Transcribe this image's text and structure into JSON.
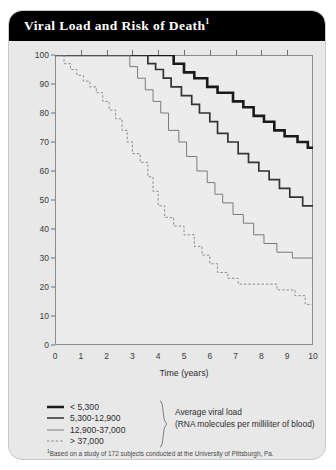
{
  "card": {
    "title": "Viral  Load and Risk of Death",
    "title_marker": "1"
  },
  "chart_data": {
    "type": "line",
    "title": "Viral Load and Risk of Death",
    "xlabel": "Time (years)",
    "ylabel": "Percentage of HIV-infected individuals surviving",
    "xlim": [
      0,
      10
    ],
    "ylim": [
      0,
      100
    ],
    "xticks": [
      "0",
      "1",
      "2",
      "3",
      "4",
      "5",
      "6",
      "7",
      "8",
      "9",
      "10"
    ],
    "yticks": [
      "0",
      "10",
      "20",
      "30",
      "40",
      "50",
      "60",
      "70",
      "80",
      "90",
      "100"
    ],
    "grid": false,
    "legend_position": "below-plot",
    "step_style": "kaplan-meier-step",
    "series": [
      {
        "name": "< 5,300",
        "style": "solid",
        "width": 2.6,
        "color": "#1a1a1a",
        "points": [
          [
            0,
            100
          ],
          [
            4.6,
            100
          ],
          [
            4.6,
            97
          ],
          [
            5.0,
            97
          ],
          [
            5.0,
            94
          ],
          [
            5.4,
            94
          ],
          [
            5.4,
            92
          ],
          [
            5.9,
            92
          ],
          [
            5.9,
            89
          ],
          [
            6.3,
            89
          ],
          [
            6.3,
            87
          ],
          [
            6.9,
            87
          ],
          [
            6.9,
            84
          ],
          [
            7.3,
            84
          ],
          [
            7.3,
            82
          ],
          [
            7.7,
            82
          ],
          [
            7.7,
            79
          ],
          [
            8.1,
            79
          ],
          [
            8.1,
            77
          ],
          [
            8.5,
            77
          ],
          [
            8.5,
            74
          ],
          [
            8.9,
            74
          ],
          [
            8.9,
            72
          ],
          [
            9.4,
            72
          ],
          [
            9.4,
            70
          ],
          [
            9.8,
            70
          ],
          [
            9.8,
            68
          ],
          [
            10,
            68
          ]
        ]
      },
      {
        "name": "5,300-12,900",
        "style": "solid",
        "width": 1.7,
        "color": "#333333",
        "points": [
          [
            0,
            100
          ],
          [
            3.6,
            100
          ],
          [
            3.6,
            97
          ],
          [
            3.9,
            97
          ],
          [
            3.9,
            95
          ],
          [
            4.2,
            95
          ],
          [
            4.2,
            92
          ],
          [
            4.5,
            92
          ],
          [
            4.5,
            89
          ],
          [
            4.9,
            89
          ],
          [
            4.9,
            86
          ],
          [
            5.3,
            86
          ],
          [
            5.3,
            83
          ],
          [
            5.6,
            83
          ],
          [
            5.6,
            80
          ],
          [
            6.0,
            80
          ],
          [
            6.0,
            77
          ],
          [
            6.3,
            77
          ],
          [
            6.3,
            73
          ],
          [
            6.7,
            73
          ],
          [
            6.7,
            70
          ],
          [
            7.1,
            70
          ],
          [
            7.1,
            66
          ],
          [
            7.5,
            66
          ],
          [
            7.5,
            63
          ],
          [
            7.9,
            63
          ],
          [
            7.9,
            60
          ],
          [
            8.3,
            60
          ],
          [
            8.3,
            57
          ],
          [
            8.7,
            57
          ],
          [
            8.7,
            54
          ],
          [
            9.1,
            54
          ],
          [
            9.1,
            51
          ],
          [
            9.6,
            51
          ],
          [
            9.6,
            48
          ],
          [
            10,
            48
          ]
        ]
      },
      {
        "name": "12,900-37,000",
        "style": "solid",
        "width": 1.0,
        "color": "#7a7a7a",
        "points": [
          [
            0,
            100
          ],
          [
            2.9,
            100
          ],
          [
            2.9,
            96
          ],
          [
            3.2,
            96
          ],
          [
            3.2,
            92
          ],
          [
            3.5,
            92
          ],
          [
            3.5,
            88
          ],
          [
            3.8,
            88
          ],
          [
            3.8,
            84
          ],
          [
            4.1,
            84
          ],
          [
            4.1,
            80
          ],
          [
            4.4,
            80
          ],
          [
            4.4,
            74
          ],
          [
            4.8,
            74
          ],
          [
            4.8,
            70
          ],
          [
            5.1,
            70
          ],
          [
            5.1,
            65
          ],
          [
            5.5,
            65
          ],
          [
            5.5,
            60
          ],
          [
            5.9,
            60
          ],
          [
            5.9,
            56
          ],
          [
            6.2,
            56
          ],
          [
            6.2,
            52
          ],
          [
            6.5,
            52
          ],
          [
            6.5,
            49
          ],
          [
            6.9,
            49
          ],
          [
            6.9,
            45
          ],
          [
            7.3,
            45
          ],
          [
            7.3,
            42
          ],
          [
            7.7,
            42
          ],
          [
            7.7,
            38
          ],
          [
            8.1,
            38
          ],
          [
            8.1,
            35
          ],
          [
            8.6,
            35
          ],
          [
            8.6,
            32
          ],
          [
            9.2,
            32
          ],
          [
            9.2,
            30
          ],
          [
            10,
            30
          ]
        ]
      },
      {
        "name": "> 37,000",
        "style": "dashed",
        "width": 1.0,
        "color": "#8a8a8a",
        "points": [
          [
            0,
            100
          ],
          [
            0.35,
            100
          ],
          [
            0.35,
            97
          ],
          [
            0.6,
            97
          ],
          [
            0.6,
            95
          ],
          [
            0.85,
            95
          ],
          [
            0.85,
            93
          ],
          [
            1.1,
            93
          ],
          [
            1.1,
            91
          ],
          [
            1.35,
            91
          ],
          [
            1.35,
            89
          ],
          [
            1.6,
            89
          ],
          [
            1.6,
            87
          ],
          [
            1.85,
            87
          ],
          [
            1.85,
            84
          ],
          [
            2.1,
            84
          ],
          [
            2.1,
            81
          ],
          [
            2.35,
            81
          ],
          [
            2.35,
            78
          ],
          [
            2.6,
            78
          ],
          [
            2.6,
            74
          ],
          [
            2.8,
            74
          ],
          [
            2.8,
            70
          ],
          [
            3.0,
            70
          ],
          [
            3.0,
            66
          ],
          [
            3.3,
            66
          ],
          [
            3.3,
            63
          ],
          [
            3.6,
            63
          ],
          [
            3.6,
            58
          ],
          [
            3.8,
            58
          ],
          [
            3.8,
            53
          ],
          [
            4.0,
            53
          ],
          [
            4.0,
            48
          ],
          [
            4.25,
            48
          ],
          [
            4.25,
            44
          ],
          [
            4.6,
            44
          ],
          [
            4.6,
            41
          ],
          [
            5.0,
            41
          ],
          [
            5.0,
            38
          ],
          [
            5.4,
            38
          ],
          [
            5.4,
            34
          ],
          [
            5.7,
            34
          ],
          [
            5.7,
            31
          ],
          [
            6.0,
            31
          ],
          [
            6.0,
            28
          ],
          [
            6.3,
            28
          ],
          [
            6.3,
            25
          ],
          [
            6.7,
            25
          ],
          [
            6.7,
            23
          ],
          [
            7.1,
            23
          ],
          [
            7.1,
            21
          ],
          [
            8.6,
            21
          ],
          [
            8.6,
            19
          ],
          [
            9.3,
            19
          ],
          [
            9.3,
            17
          ],
          [
            9.7,
            17
          ],
          [
            9.7,
            14
          ],
          [
            10,
            14
          ]
        ]
      }
    ]
  },
  "legend": {
    "items": [
      {
        "label": "< 5,300",
        "style": "solid",
        "width": 2.6,
        "color": "#1a1a1a"
      },
      {
        "label": "5,300-12,900",
        "style": "solid",
        "width": 1.7,
        "color": "#333333"
      },
      {
        "label": "12,900-37,000",
        "style": "solid",
        "width": 1.0,
        "color": "#7a7a7a"
      },
      {
        "label": "> 37,000",
        "style": "dashed",
        "width": 1.0,
        "color": "#8a8a8a"
      }
    ],
    "note_line1": "Average viral load",
    "note_line2": "(RNA molecules per milliliter of blood)"
  },
  "footnote": {
    "marker": "1",
    "text": "Based on a study of 172 subjects conducted at the University of Pittsburgh, Pa."
  }
}
